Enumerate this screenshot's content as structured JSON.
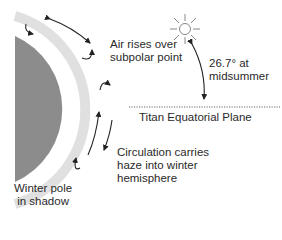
{
  "diagram": {
    "type": "atmospheric-circulation",
    "subject": "Titan",
    "labels": {
      "air_rises_line1": "Air rises over",
      "air_rises_line2": "subpolar point",
      "angle_line1": "26.7° at",
      "angle_line2": "midsummer",
      "equatorial_plane": "Titan Equatorial Plane",
      "circulation_line1": "Circulation carries",
      "circulation_line2": "haze into winter",
      "circulation_line3": "hemisphere",
      "winter_pole_line1": "Winter pole",
      "winter_pole_line2": "in shadow"
    },
    "icons": [
      "sun-icon"
    ],
    "colors": {
      "planet": "#8c8c8c",
      "haze_ring": "#e0e0e0",
      "arrows": "#222222",
      "text": "#2a2a2a"
    }
  }
}
